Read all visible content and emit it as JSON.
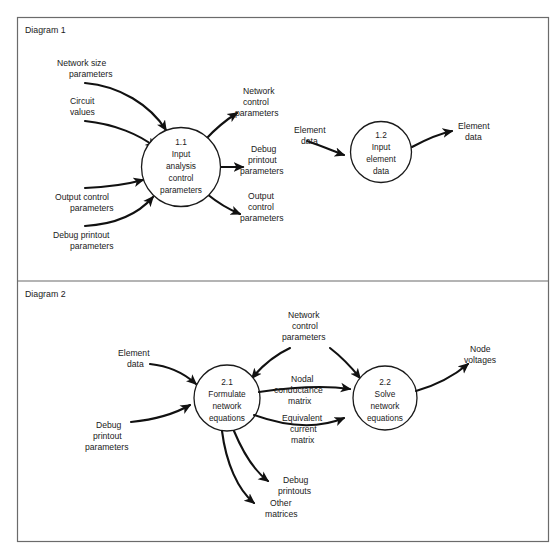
{
  "page": {
    "caption": ""
  },
  "panels": [
    {
      "title": "Diagram 1",
      "processes": [
        {
          "id": "1.1",
          "lines": [
            "1.1",
            "Input",
            "analysis",
            "control",
            "parameters"
          ]
        },
        {
          "id": "1.2",
          "lines": [
            "1.2",
            "Input",
            "element",
            "data"
          ]
        }
      ],
      "inputs": [
        {
          "lines": [
            "Network size",
            "parameters"
          ]
        },
        {
          "lines": [
            "Circuit",
            "values"
          ]
        },
        {
          "lines": [
            "Output control",
            "parameters"
          ]
        },
        {
          "lines": [
            "Debug printout",
            "parameters"
          ]
        },
        {
          "lines": [
            "Element",
            "data"
          ]
        }
      ],
      "outputs": [
        {
          "lines": [
            "Network",
            "control",
            "parameters"
          ]
        },
        {
          "lines": [
            "Debug",
            "printout",
            "parameters"
          ]
        },
        {
          "lines": [
            "Output",
            "control",
            "parameters"
          ]
        },
        {
          "lines": [
            "Element",
            "data"
          ]
        }
      ]
    },
    {
      "title": "Diagram 2",
      "processes": [
        {
          "id": "2.1",
          "lines": [
            "2.1",
            "Formulate",
            "network",
            "equations"
          ]
        },
        {
          "id": "2.2",
          "lines": [
            "2.2",
            "Solve",
            "network",
            "equations"
          ]
        }
      ],
      "inputs": [
        {
          "lines": [
            "Element",
            "data"
          ]
        },
        {
          "lines": [
            "Debug",
            "printout",
            "parameters"
          ]
        },
        {
          "lines": [
            "Network",
            "control",
            "parameters"
          ]
        }
      ],
      "outputs": [
        {
          "lines": [
            "Nodal",
            "conductance",
            "matrix"
          ]
        },
        {
          "lines": [
            "Equivalent",
            "current",
            "matrix"
          ]
        },
        {
          "lines": [
            "Debug",
            "printouts"
          ]
        },
        {
          "lines": [
            "Other",
            "matrices"
          ]
        },
        {
          "lines": [
            "Node",
            "voltages"
          ]
        }
      ]
    }
  ],
  "text": {
    "diagram1_title": "Diagram 1",
    "diagram2_title": "Diagram 2",
    "d1_p1_l1": "1.1",
    "d1_p1_l2": "Input",
    "d1_p1_l3": "analysis",
    "d1_p1_l4": "control",
    "d1_p1_l5": "parameters",
    "d1_p2_l1": "1.2",
    "d1_p2_l2": "Input",
    "d1_p2_l3": "element",
    "d1_p2_l4": "data",
    "d1_in1_l1": "Network size",
    "d1_in1_l2": "parameters",
    "d1_in2_l1": "Circuit",
    "d1_in2_l2": "values",
    "d1_in3_l1": "Output control",
    "d1_in3_l2": "parameters",
    "d1_in4_l1": "Debug printout",
    "d1_in4_l2": "parameters",
    "d1_out1_l1": "Network",
    "d1_out1_l2": "control",
    "d1_out1_l3": "parameters",
    "d1_out2_l1": "Debug",
    "d1_out2_l2": "printout",
    "d1_out2_l3": "parameters",
    "d1_out3_l1": "Output",
    "d1_out3_l2": "control",
    "d1_out3_l3": "parameters",
    "d1_mid_l1": "Element",
    "d1_mid_l2": "data",
    "d1_right_l1": "Element",
    "d1_right_l2": "data",
    "d2_p1_l1": "2.1",
    "d2_p1_l2": "Formulate",
    "d2_p1_l3": "network",
    "d2_p1_l4": "equations",
    "d2_p2_l1": "2.2",
    "d2_p2_l2": "Solve",
    "d2_p2_l3": "network",
    "d2_p2_l4": "equations",
    "d2_in1_l1": "Element",
    "d2_in1_l2": "data",
    "d2_in2_l1": "Debug",
    "d2_in2_l2": "printout",
    "d2_in2_l3": "parameters",
    "d2_top_l1": "Network",
    "d2_top_l2": "control",
    "d2_top_l3": "parameters",
    "d2_mid1_l1": "Nodal",
    "d2_mid1_l2": "conductance",
    "d2_mid1_l3": "matrix",
    "d2_mid2_l1": "Equivalent",
    "d2_mid2_l2": "current",
    "d2_mid2_l3": "matrix",
    "d2_out1_l1": "Debug",
    "d2_out1_l2": "printouts",
    "d2_out2_l1": "Other",
    "d2_out2_l2": "matrices",
    "d2_right_l1": "Node",
    "d2_right_l2": "voltages"
  }
}
